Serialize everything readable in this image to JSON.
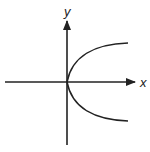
{
  "diagram": {
    "type": "coordinate-axes-with-curve",
    "axes": {
      "x_label": "x",
      "y_label": "y"
    },
    "curve": {
      "description": "sideways parabola opening to the right, vertex at origin"
    },
    "colors": {
      "stroke": "#222222",
      "background": "#ffffff"
    }
  }
}
